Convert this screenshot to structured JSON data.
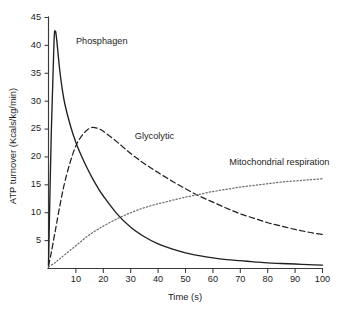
{
  "chart_data": {
    "type": "line",
    "title": "",
    "xlabel": "Time (s)",
    "ylabel": "ATP turnover (Kcals/kg/min)",
    "xlim": [
      0,
      100
    ],
    "ylim": [
      0,
      45
    ],
    "xticks": [
      10,
      20,
      30,
      40,
      50,
      60,
      70,
      80,
      90,
      100
    ],
    "yticks": [
      5,
      10,
      15,
      20,
      25,
      30,
      35,
      40,
      45
    ],
    "xtick_labels": [
      "10",
      "20",
      "30",
      "40",
      "50",
      "60",
      "70",
      "80",
      "90",
      "100"
    ],
    "ytick_labels": [
      "5",
      "10",
      "15",
      "20",
      "25",
      "30",
      "35",
      "40",
      "45"
    ],
    "grid": false,
    "legend_position": "inline-annotations",
    "background_color": "#ffffff",
    "axis_color": "#3a3a3a",
    "text_color": "#1c1c1c",
    "x": [
      0,
      1,
      2,
      2.5,
      3,
      4,
      5,
      6,
      8,
      10,
      12,
      14,
      16,
      18,
      20,
      25,
      30,
      35,
      40,
      45,
      50,
      55,
      60,
      65,
      70,
      75,
      80,
      85,
      90,
      95,
      100
    ],
    "series": [
      {
        "name": "Phosphagen",
        "style": "solid",
        "color": "#202020",
        "label_x": 10,
        "label_y": 40.2,
        "values": [
          0.6,
          24.0,
          40.5,
          42.5,
          41.0,
          36.0,
          32.2,
          29.4,
          25.6,
          22.6,
          20.2,
          18.1,
          16.2,
          14.5,
          13.0,
          9.8,
          7.4,
          5.7,
          4.4,
          3.5,
          2.8,
          2.3,
          1.9,
          1.6,
          1.4,
          1.2,
          1.0,
          0.9,
          0.8,
          0.7,
          0.6
        ]
      },
      {
        "name": "Glycolytic",
        "style": "dashed",
        "color": "#202020",
        "label_x": 31.5,
        "label_y": 23.3,
        "values": [
          0.5,
          2.8,
          5.5,
          6.8,
          8.2,
          10.9,
          13.4,
          15.6,
          19.2,
          22.0,
          23.7,
          24.8,
          25.3,
          25.1,
          24.6,
          22.7,
          20.6,
          18.8,
          17.2,
          15.7,
          14.3,
          13.0,
          11.9,
          10.8,
          9.8,
          9.0,
          8.2,
          7.6,
          7.0,
          6.5,
          6.1
        ]
      },
      {
        "name": "Mitochondrial respiration",
        "style": "dotted",
        "color": "#6e6e6e",
        "label_x": 66,
        "label_y": 18.6,
        "values": [
          0.3,
          0.6,
          0.9,
          1.1,
          1.3,
          1.7,
          2.1,
          2.5,
          3.3,
          4.1,
          4.9,
          5.7,
          6.4,
          7.0,
          7.6,
          8.9,
          10.0,
          10.9,
          11.6,
          12.2,
          12.8,
          13.3,
          13.8,
          14.2,
          14.6,
          14.9,
          15.2,
          15.5,
          15.7,
          15.9,
          16.1
        ]
      }
    ]
  }
}
